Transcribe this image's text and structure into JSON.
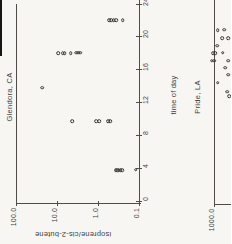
{
  "figure": {
    "background_color": "#f7f6f2",
    "ink_color": "#504c47",
    "description_flags": {
      "rotated_page_figure": true,
      "scan_edge_artifact": true,
      "right_panel_cropped": true
    }
  },
  "chart_data": [
    {
      "type": "scatter",
      "title": "Glendora, CA",
      "xlabel": "time of day",
      "ylabel": "isoprene/cis-2-butene",
      "xlim": [
        0,
        24
      ],
      "x_tick_labels": [
        "0",
        "4",
        "8",
        "12",
        "16",
        "20",
        "24"
      ],
      "yscale": "log",
      "ylim": [
        0.1,
        100.0
      ],
      "y_tick_labels": [
        "100.0",
        "10.0",
        "1.0",
        "0.1"
      ],
      "legend": "none",
      "grid": false,
      "points": [
        [
          3.75,
          0.37
        ],
        [
          3.75,
          0.34
        ],
        [
          3.75,
          0.31
        ],
        [
          3.75,
          0.28
        ],
        [
          3.75,
          0.255
        ],
        [
          3.8,
          0.12
        ],
        [
          9.7,
          4.2
        ],
        [
          9.7,
          1.1
        ],
        [
          9.7,
          0.92
        ],
        [
          9.75,
          0.56
        ],
        [
          9.75,
          0.5
        ],
        [
          13.8,
          23
        ],
        [
          18,
          9.5
        ],
        [
          18,
          7.2
        ],
        [
          18,
          6.5
        ],
        [
          18,
          4.6
        ],
        [
          18.05,
          3.4
        ],
        [
          18.05,
          3.0
        ],
        [
          18.05,
          2.7
        ],
        [
          22,
          0.54
        ],
        [
          22,
          0.47
        ],
        [
          22,
          0.41
        ],
        [
          22,
          0.36
        ],
        [
          22.05,
          0.25
        ]
      ]
    },
    {
      "type": "scatter",
      "title": "Pride, LA",
      "yscale": "log",
      "ylim_top_visible": 1000.0,
      "y_tick_labels": [
        "1000.0"
      ],
      "legend": "none",
      "grid": false,
      "cropped": true,
      "points": [
        [
          20.8,
          820
        ],
        [
          20.85,
          555
        ],
        [
          19.8,
          640
        ],
        [
          19.8,
          445
        ],
        [
          18.9,
          845
        ],
        [
          18.0,
          1060
        ],
        [
          18.0,
          920
        ],
        [
          18.05,
          620
        ],
        [
          17.1,
          1150
        ],
        [
          17.1,
          1000
        ],
        [
          17.1,
          445
        ],
        [
          16.25,
          525
        ],
        [
          15.4,
          455
        ],
        [
          14.4,
          820
        ],
        [
          13.3,
          470
        ],
        [
          12.8,
          420
        ]
      ]
    }
  ]
}
